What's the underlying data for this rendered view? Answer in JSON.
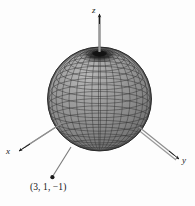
{
  "figure": {
    "kind": "3d-sphere-wireframe-plot",
    "background_color": "#fdfdfd",
    "axes": {
      "z": {
        "label": "z",
        "direction": "up"
      },
      "x": {
        "label": "x",
        "direction": "down-left"
      },
      "y": {
        "label": "y",
        "direction": "down-right"
      },
      "axis_color": "#8c8c8c",
      "arrow_color": "#1f1f1f"
    },
    "sphere": {
      "name": "wireframe-sphere",
      "center_px": [
        99.5,
        99
      ],
      "radius_px": 52,
      "fill_color": "#8e8e8e",
      "mesh_color": "#3a3a3a",
      "pole_color": "#121212",
      "edge_color": "#2b2b2b",
      "meridians": 28,
      "parallels": 18
    },
    "annotation": {
      "name": "center-point-callout",
      "text": "(3, 1, −1)",
      "dot_px": [
        52,
        178
      ],
      "leader_from_px": [
        70,
        148
      ],
      "leader_color": "#6e6e6e",
      "dot_color": "#1a1a1a"
    }
  }
}
